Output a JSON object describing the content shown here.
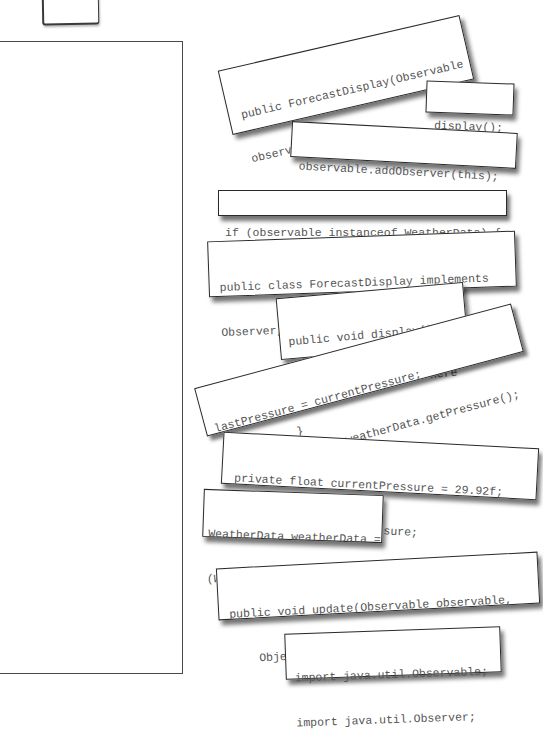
{
  "puzzle": {
    "type": "code-magnets",
    "answer_area": "blank"
  },
  "magnets": [
    {
      "id": "constructor",
      "lines": [
        "public ForecastDisplay(Observable",
        "observable) {"
      ]
    },
    {
      "id": "display-call",
      "lines": [
        "display();"
      ]
    },
    {
      "id": "add-observer",
      "lines": [
        "observable.addObserver(this);"
      ]
    },
    {
      "id": "instanceof-check",
      "lines": [
        "if (observable instanceof WeatherData) {"
      ]
    },
    {
      "id": "class-declaration",
      "lines": [
        "public class ForecastDisplay implements",
        "Observer, DisplayElement {"
      ]
    },
    {
      "id": "display-method",
      "lines": [
        "public void display() {",
        "    // display code here",
        "}"
      ]
    },
    {
      "id": "pressure-assign",
      "lines": [
        "lastPressure = currentPressure;",
        "currentPressure = weatherData.getPressure();"
      ]
    },
    {
      "id": "pressure-fields",
      "lines": [
        "private float currentPressure = 29.92f;",
        "private float lastPressure;"
      ]
    },
    {
      "id": "weatherdata-cast",
      "lines": [
        "WeatherData weatherData =",
        "(WeatherData)observable;"
      ]
    },
    {
      "id": "update-method",
      "lines": [
        "public void update(Observable observable,",
        "    Object arg) {"
      ]
    },
    {
      "id": "imports",
      "lines": [
        "import java.util.Observable;",
        "import java.util.Observer;"
      ]
    }
  ]
}
